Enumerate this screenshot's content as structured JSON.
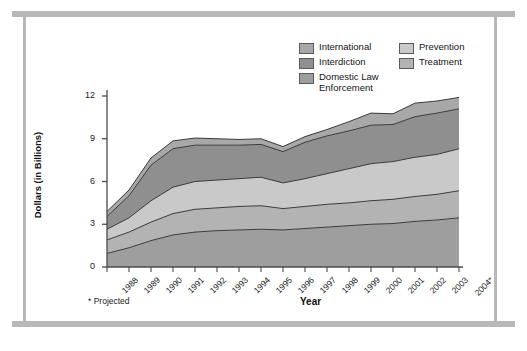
{
  "figure": {
    "footnote": "* Projected"
  },
  "legend": {
    "position": "top-center",
    "columns": [
      {
        "entries": [
          {
            "label": "International",
            "color": "#a8a8a8"
          },
          {
            "label": "Interdiction",
            "color": "#8f8f8f"
          },
          {
            "label": "Domestic Law\nEnforcement",
            "color": "#9e9e9e"
          }
        ]
      },
      {
        "entries": [
          {
            "label": "Prevention",
            "color": "#c9c9c9"
          },
          {
            "label": "Treatment",
            "color": "#b3b3b3"
          }
        ]
      }
    ]
  },
  "chart_data": {
    "type": "area",
    "stacked": true,
    "title": "",
    "xlabel": "Year",
    "ylabel": "Dollars (in Billions)",
    "xlim": [
      1988,
      2004
    ],
    "ylim": [
      0,
      12
    ],
    "yticks": [
      0,
      3,
      6,
      9,
      12
    ],
    "ytick_labels": [
      "0",
      "3",
      "6",
      "9",
      "12"
    ],
    "grid": false,
    "categories": [
      "1988",
      "1989",
      "1990",
      "1991",
      "1992",
      "1993",
      "1994",
      "1995",
      "1996",
      "1997",
      "1998",
      "1999",
      "2000",
      "2001",
      "2002",
      "2003",
      "2004*"
    ],
    "series": [
      {
        "name": "Domestic Law Enforcement",
        "color": "#9e9e9e",
        "stack_order": 1,
        "values": [
          0.95,
          1.35,
          1.85,
          2.25,
          2.45,
          2.55,
          2.6,
          2.65,
          2.6,
          2.7,
          2.8,
          2.9,
          3.0,
          3.05,
          3.2,
          3.3,
          3.45
        ]
      },
      {
        "name": "Treatment",
        "color": "#b3b3b3",
        "stack_order": 2,
        "values": [
          0.95,
          1.1,
          1.3,
          1.5,
          1.6,
          1.6,
          1.65,
          1.65,
          1.5,
          1.55,
          1.6,
          1.6,
          1.65,
          1.7,
          1.75,
          1.8,
          1.9
        ]
      },
      {
        "name": "Prevention",
        "color": "#c9c9c9",
        "stack_order": 3,
        "values": [
          0.75,
          1.0,
          1.5,
          1.85,
          1.95,
          1.95,
          1.95,
          2.0,
          1.8,
          1.95,
          2.15,
          2.4,
          2.6,
          2.65,
          2.75,
          2.8,
          2.95
        ]
      },
      {
        "name": "Interdiction",
        "color": "#8f8f8f",
        "stack_order": 4,
        "values": [
          0.9,
          1.55,
          2.5,
          2.7,
          2.55,
          2.45,
          2.35,
          2.3,
          2.2,
          2.55,
          2.65,
          2.65,
          2.7,
          2.6,
          2.85,
          2.9,
          2.8
        ]
      },
      {
        "name": "International",
        "color": "#a8a8a8",
        "stack_order": 5,
        "values": [
          0.35,
          0.4,
          0.5,
          0.55,
          0.5,
          0.45,
          0.4,
          0.4,
          0.35,
          0.4,
          0.45,
          0.65,
          0.85,
          0.75,
          0.95,
          0.85,
          0.8
        ]
      }
    ],
    "totals": [
      3.9,
      5.4,
      7.65,
      8.85,
      9.05,
      9.0,
      8.95,
      9.0,
      8.45,
      9.15,
      9.65,
      10.2,
      10.8,
      10.75,
      11.5,
      11.65,
      11.9
    ]
  }
}
